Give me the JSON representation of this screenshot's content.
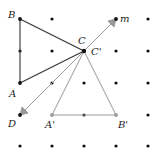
{
  "diagram": {
    "grid": {
      "cols": [
        20,
        52,
        84,
        116,
        148
      ],
      "rows": [
        19,
        51,
        83,
        115,
        146
      ],
      "dot_color": "#111111"
    },
    "labels": {
      "B": "B",
      "A": "A",
      "C": "C",
      "C_prime": "C'",
      "D": "D",
      "m": "m",
      "A_prime": "A'",
      "B_prime": "B'"
    },
    "points": {
      "B": [
        20,
        19
      ],
      "A": [
        20,
        83
      ],
      "C": [
        84,
        51
      ],
      "D": [
        20,
        115
      ],
      "m": [
        116,
        19
      ],
      "A_prime": [
        52,
        115
      ],
      "B_prime": [
        116,
        115
      ]
    },
    "colors": {
      "original_triangle": "#333333",
      "image_triangle": "#999999",
      "vectors": "#999999"
    }
  }
}
